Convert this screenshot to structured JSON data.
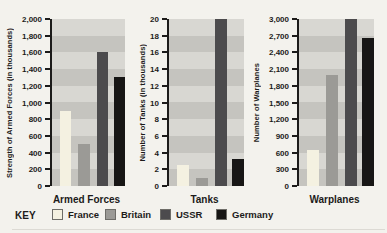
{
  "key_label": "KEY",
  "legend": [
    {
      "name": "France",
      "color": "#f4f1e1"
    },
    {
      "name": "Britain",
      "color": "#9b9a96"
    },
    {
      "name": "USSR",
      "color": "#4c4b4d"
    },
    {
      "name": "Germany",
      "color": "#171615"
    }
  ],
  "colors": {
    "paper": "#f3f2ed",
    "band_light": "#d8d7d2",
    "band_dark": "#c5c4bf",
    "ink": "#1c1b1a"
  },
  "chart_data": [
    {
      "type": "bar",
      "title": "Armed Forces",
      "ylabel": "Strength of Armed Forces (in thousands)",
      "categories": [
        "France",
        "Britain",
        "USSR",
        "Germany"
      ],
      "values": [
        900,
        500,
        1600,
        1300
      ],
      "ylim": [
        0,
        2000
      ],
      "ytick_step": 200,
      "yticks": [
        "2,000",
        "1,800",
        "1,600",
        "1,400",
        "1,200",
        "1,000",
        "800",
        "600",
        "400",
        "200",
        "0"
      ],
      "grid": "striped-bands",
      "legend_position": "bottom"
    },
    {
      "type": "bar",
      "title": "Tanks",
      "ylabel": "Number of Tanks (in thousands)",
      "categories": [
        "France",
        "Britain",
        "USSR",
        "Germany"
      ],
      "values": [
        2.5,
        1,
        20,
        3.2
      ],
      "ylim": [
        0,
        20
      ],
      "ytick_step": 2,
      "yticks": [
        "20",
        "18",
        "16",
        "14",
        "12",
        "10",
        "8",
        "6",
        "4",
        "2",
        "0"
      ],
      "grid": "striped-bands",
      "note": "USSR bar reaches the top of the axis",
      "legend_position": "bottom"
    },
    {
      "type": "bar",
      "title": "Warplanes",
      "ylabel": "Number of Warplanes",
      "categories": [
        "France",
        "Britain",
        "USSR",
        "Germany"
      ],
      "values": [
        650,
        2000,
        3000,
        2650
      ],
      "ylim": [
        0,
        3000
      ],
      "ytick_step": 300,
      "yticks": [
        "3,000",
        "2,700",
        "2,400",
        "2,100",
        "1,800",
        "1,500",
        "1,200",
        "900",
        "600",
        "300",
        "0"
      ],
      "grid": "striped-bands",
      "note": "USSR bar reaches the top of the axis",
      "legend_position": "bottom"
    }
  ]
}
